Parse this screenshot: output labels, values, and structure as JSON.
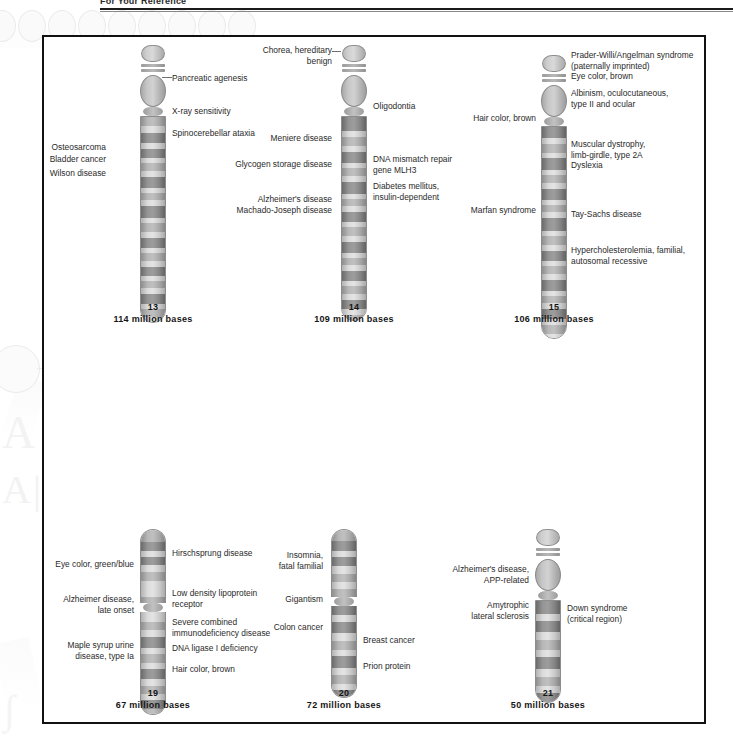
{
  "header": {
    "title": "For Your Reference"
  },
  "figure": {
    "caption_unit": "million bases"
  },
  "chromosomes": [
    {
      "id": "chr13",
      "number": "13",
      "size_text": "114 million bases",
      "left_labels": [
        "Osteosarcoma",
        "Bladder cancer",
        "Wilson disease"
      ],
      "right_labels": [
        "Pancreatic agenesis",
        "X-ray sensitivity",
        "Spinocerebellar ataxia"
      ]
    },
    {
      "id": "chr14",
      "number": "14",
      "size_text": "109 million bases",
      "left_labels": [
        "Chorea, hereditary\nbenign",
        "Meniere disease",
        "Glycogen storage disease",
        "Alzheimer's disease",
        "Machado-Joseph disease"
      ],
      "right_labels": [
        "Oligodontia",
        "DNA mismatch repair\ngene MLH3",
        "Diabetes mellitus,\ninsulin-dependent"
      ]
    },
    {
      "id": "chr15",
      "number": "15",
      "size_text": "106 million bases",
      "left_labels": [
        "Hair color, brown",
        "Marfan syndrome"
      ],
      "right_labels": [
        "Prader-Willi/Angelman syndrome\n(paternally imprinted)\nEye color, brown",
        "Albinism, oculocutaneous,\ntype II and ocular",
        "Muscular dystrophy,\nlimb-girdle, type 2A\nDyslexia",
        "Tay-Sachs disease",
        "Hypercholesterolemia, familial,\nautosomal recessive"
      ]
    },
    {
      "id": "chr19",
      "number": "19",
      "size_text": "67 million bases",
      "left_labels": [
        "Eye color, green/blue",
        "Alzheimer disease,\nlate onset",
        "Maple syrup urine\ndisease, type Ia"
      ],
      "right_labels": [
        "Hirschsprung disease",
        "Low density lipoprotein\nreceptor",
        "Severe combined\nimmunodeficiency disease",
        "DNA ligase I deficiency",
        "Hair color, brown"
      ]
    },
    {
      "id": "chr20",
      "number": "20",
      "size_text": "72 million bases",
      "left_labels": [
        "Insomnia,\nfatal familial",
        "Gigantism",
        "Colon cancer"
      ],
      "right_labels": [
        "Breast cancer",
        "Prion protein"
      ]
    },
    {
      "id": "chr21",
      "number": "21",
      "size_text": "50 million bases",
      "left_labels": [
        "Alzheimer's disease,\nAPP-related",
        "Amytrophic\nlateral sclerosis"
      ],
      "right_labels": [
        "Down syndrome\n(critical region)"
      ]
    }
  ],
  "colors": {
    "band_dark": "#8d8d8d",
    "band_mid": "#b0b0b0",
    "band_light": "#d4d4d4",
    "outline": "#8a8a8a",
    "panel_border": "#111111",
    "text": "#2a2a2a"
  }
}
